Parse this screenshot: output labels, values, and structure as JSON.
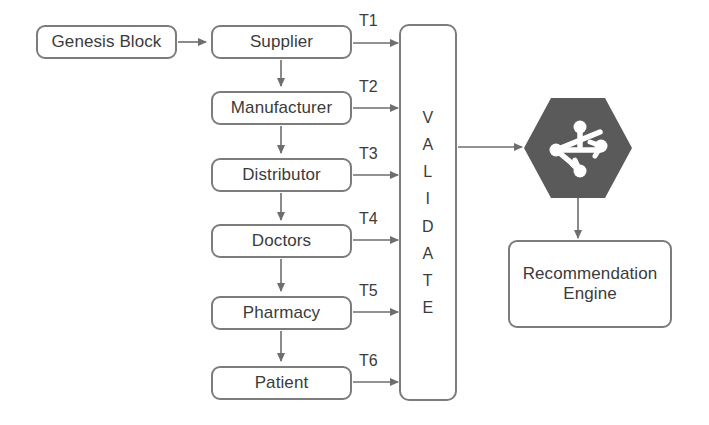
{
  "diagram": {
    "colors": {
      "border": "#7c7c7c",
      "text": "#3b3b3b",
      "arrow": "#6e6e6e",
      "hexagon_fill": "#5a5a5a",
      "background": "#ffffff"
    },
    "genesis": {
      "label": "Genesis Block"
    },
    "chain": [
      {
        "label": "Supplier",
        "tx": "T1"
      },
      {
        "label": "Manufacturer",
        "tx": "T2"
      },
      {
        "label": "Distributor",
        "tx": "T3"
      },
      {
        "label": "Doctors",
        "tx": "T4"
      },
      {
        "label": "Pharmacy",
        "tx": "T5"
      },
      {
        "label": "Patient",
        "tx": "T6"
      }
    ],
    "validate": {
      "label": "VALIDATE",
      "letters": [
        "V",
        "A",
        "L",
        "I",
        "D",
        "A",
        "T",
        "E"
      ]
    },
    "hexagon": {
      "icon_name": "share-network-icon"
    },
    "recommendation": {
      "line1": "Recommendation",
      "line2": "Engine"
    }
  }
}
